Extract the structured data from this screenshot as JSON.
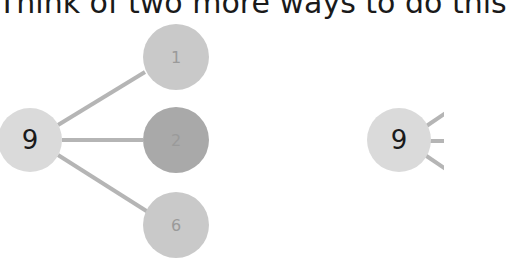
{
  "instruction": "Think of two more ways to do this",
  "colors": {
    "whole_fill": "#dadada",
    "part_light_fill": "#c9c9c9",
    "part_dark_fill": "#a9a9a9",
    "connector": "#b5b5b5",
    "whole_text": "#1a1a1a",
    "part_text": "#9a9a9a"
  },
  "diagrams": [
    {
      "whole": "9",
      "parts": [
        "1",
        "2",
        "6"
      ]
    },
    {
      "whole": "9",
      "parts": [
        "",
        "",
        ""
      ]
    }
  ]
}
